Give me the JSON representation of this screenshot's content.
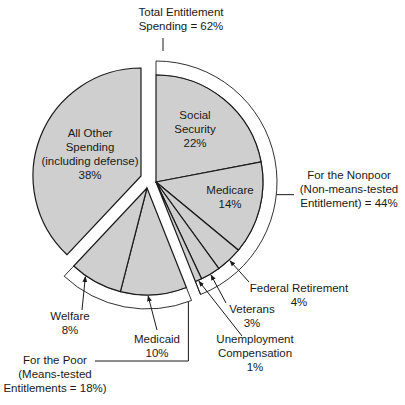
{
  "chart_data": {
    "type": "pie",
    "title": "",
    "colors": {
      "slice_fill": "#cfcfcf",
      "bracket_fill": "#ffffff",
      "stroke": "#1a1a1a",
      "background": "#ffffff"
    },
    "groups": [
      {
        "name": "Total Entitlement Spending",
        "value": 62,
        "subgroups": [
          {
            "name": "For the Nonpoor (Non-means-tested Entitlement)",
            "value": 44,
            "slices": [
              {
                "label": "Social Security",
                "value": 22
              },
              {
                "label": "Medicare",
                "value": 14
              },
              {
                "label": "Federal Retirement",
                "value": 4
              },
              {
                "label": "Veterans",
                "value": 3
              },
              {
                "label": "Unemployment Compensation",
                "value": 1
              }
            ]
          },
          {
            "name": "For the Poor (Means-tested Entitlements)",
            "value": 18,
            "slices": [
              {
                "label": "Medicaid",
                "value": 10
              },
              {
                "label": "Welfare",
                "value": 8
              }
            ]
          }
        ]
      },
      {
        "name": "All Other Spending (including defense)",
        "value": 38,
        "slices": [
          {
            "label": "All Other Spending (including defense)",
            "value": 38
          }
        ]
      }
    ],
    "categories": [
      "Social Security",
      "Medicare",
      "Federal Retirement",
      "Veterans",
      "Unemployment Compensation",
      "Medicaid",
      "Welfare",
      "All Other Spending (including defense)"
    ],
    "values": [
      22,
      14,
      4,
      3,
      1,
      10,
      8,
      38
    ],
    "unit": "%"
  },
  "labels": {
    "total": {
      "line1": "Total Entitlement",
      "line2": "Spending = 62%"
    },
    "nonpoor": {
      "line1": "For the Nonpoor",
      "line2": "(Non-means-tested",
      "line3": "Entitlement) = 44%"
    },
    "poor": {
      "line1": "For the Poor",
      "line2": "(Means-tested",
      "line3": "Entitlements = 18%)"
    },
    "social_security": {
      "line1": "Social",
      "line2": "Security",
      "line3": "22%"
    },
    "medicare": {
      "line1": "Medicare",
      "line2": "14%"
    },
    "federal_retirement": {
      "line1": "Federal Retirement",
      "line2": "4%"
    },
    "veterans": {
      "line1": "Veterans",
      "line2": "3%"
    },
    "unemployment": {
      "line1": "Unemployment",
      "line2": "Compensation",
      "line3": "1%"
    },
    "medicaid": {
      "line1": "Medicaid",
      "line2": "10%"
    },
    "welfare": {
      "line1": "Welfare",
      "line2": "8%"
    },
    "other": {
      "line1": "All Other",
      "line2": "Spending",
      "line3": "(including defense)",
      "line4": "38%"
    }
  }
}
